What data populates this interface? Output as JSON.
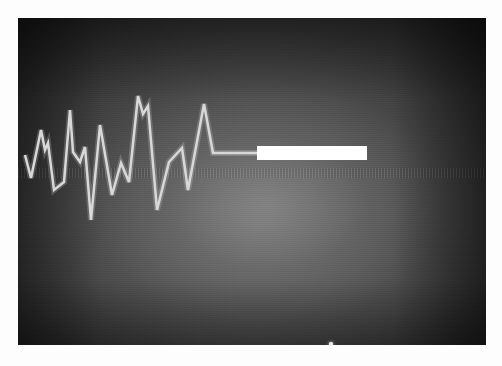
{
  "scene": {
    "description": "Photograph of a glowing waveform trace on a dark screen with a white rectangular bar",
    "background_color": "#2a2a2a",
    "center_glow_color": "#7a7a7a",
    "trace_color": "#d8d8d8"
  },
  "waveform": {
    "points": [
      [
        25,
        155
      ],
      [
        31,
        178
      ],
      [
        41,
        130
      ],
      [
        45,
        150
      ],
      [
        48,
        143
      ],
      [
        54,
        190
      ],
      [
        64,
        182
      ],
      [
        70,
        110
      ],
      [
        73,
        152
      ],
      [
        80,
        162
      ],
      [
        85,
        147
      ],
      [
        91,
        220
      ],
      [
        100,
        125
      ],
      [
        112,
        195
      ],
      [
        121,
        163
      ],
      [
        129,
        182
      ],
      [
        138,
        96
      ],
      [
        143,
        114
      ],
      [
        148,
        106
      ],
      [
        157,
        210
      ],
      [
        169,
        162
      ],
      [
        182,
        148
      ],
      [
        188,
        190
      ],
      [
        204,
        104
      ],
      [
        213,
        153
      ],
      [
        257,
        153
      ]
    ],
    "stroke_width": 2.5
  },
  "marker_bar": {
    "x": 257,
    "y": 146,
    "width": 110,
    "height": 14,
    "color": "#ffffff"
  },
  "bright_spot": {
    "x": 331,
    "y": 344
  }
}
